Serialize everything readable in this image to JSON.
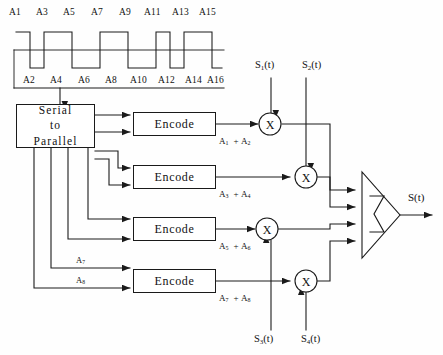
{
  "diagram": {
    "output_signal": "S(t)",
    "stroke_color": "#1a1a1a",
    "background_color": "#fefefe"
  },
  "waveform": {
    "caption_top_labels": [
      "A1",
      "A3",
      "A5",
      "A7",
      "A9",
      "A11",
      "A13",
      "A15"
    ],
    "caption_bottom_labels": [
      "A2",
      "A4",
      "A6",
      "A8",
      "A10",
      "A12",
      "A14",
      "A16"
    ],
    "top_label_text": [
      "A",
      "A",
      "A",
      "A",
      "A",
      "A",
      "A",
      "A"
    ],
    "top_label_subs": [
      "1",
      "3",
      "5",
      "7",
      "9",
      "11",
      "13",
      "15"
    ],
    "bottom_label_subs": [
      "2",
      "4",
      "6",
      "8",
      "10",
      "12",
      "14",
      "16"
    ],
    "levels": [
      1,
      -1,
      1,
      -1,
      1,
      -1,
      1,
      -1,
      1,
      -1,
      1,
      -1,
      1,
      -1,
      1,
      -1
    ],
    "description": "binary NRZ square wave alternating high/low"
  },
  "serial_to_parallel": {
    "line1": "Serial",
    "line2": "to",
    "line3": "Parallel"
  },
  "encoders": [
    {
      "label": "Encode",
      "output_prefix": "A",
      "output_sub_a": "1",
      "output_sub_b": "2",
      "output_label": "A1 + A2"
    },
    {
      "label": "Encode",
      "output_prefix": "A",
      "output_sub_a": "3",
      "output_sub_b": "4",
      "output_label": "A3 + A4"
    },
    {
      "label": "Encode",
      "output_prefix": "A",
      "output_sub_a": "5",
      "output_sub_b": "6",
      "output_label": "A5 + A6"
    },
    {
      "label": "Encode",
      "output_prefix": "A",
      "output_sub_a": "7",
      "output_sub_b": "8",
      "output_label": "A7 + A8"
    }
  ],
  "port_labels": {
    "a7": "A",
    "a7_sub": "7",
    "a8": "A",
    "a8_sub": "8"
  },
  "mixers": [
    {
      "symbol": "X",
      "name": "mixer-1"
    },
    {
      "symbol": "X",
      "name": "mixer-2"
    },
    {
      "symbol": "X",
      "name": "mixer-3"
    },
    {
      "symbol": "X",
      "name": "mixer-4"
    }
  ],
  "carriers": {
    "top": [
      {
        "prefix": "S",
        "sub": "1",
        "suffix": "(t)",
        "full": "S1(t)"
      },
      {
        "prefix": "S",
        "sub": "2",
        "suffix": "(t)",
        "full": "S2(t)"
      }
    ],
    "bottom": [
      {
        "prefix": "S",
        "sub": "3",
        "suffix": "(t)",
        "full": "S3(t)"
      },
      {
        "prefix": "S",
        "sub": "4",
        "suffix": "(t)",
        "full": "S4(t)"
      }
    ]
  },
  "summer": {
    "symbol": "Σ",
    "name": "summing-junction"
  },
  "output": {
    "label": "S(t)"
  }
}
